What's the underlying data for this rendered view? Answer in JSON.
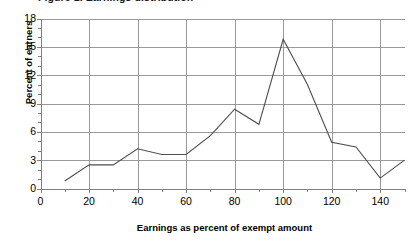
{
  "chart_data": {
    "type": "line",
    "title": "Figure 1. Earnings distribution",
    "xlabel": "Earnings as percent of exempt amount",
    "ylabel": "Percent of earners",
    "x": [
      10,
      20,
      30,
      40,
      50,
      60,
      70,
      80,
      90,
      100,
      110,
      120,
      130,
      140,
      150
    ],
    "values": [
      0.8,
      2.5,
      2.5,
      4.2,
      3.6,
      3.6,
      5.6,
      8.4,
      6.8,
      15.8,
      11.0,
      4.9,
      4.4,
      1.1,
      3.0
    ],
    "series": [
      {
        "name": "Percent of earners",
        "values": [
          0.8,
          2.5,
          2.5,
          4.2,
          3.6,
          3.6,
          5.6,
          8.4,
          6.8,
          15.8,
          11.0,
          4.9,
          4.4,
          1.1,
          3.0
        ]
      }
    ],
    "xlim": [
      0,
      150
    ],
    "ylim": [
      0,
      18
    ],
    "x_ticks": [
      0,
      20,
      40,
      60,
      80,
      100,
      120,
      140
    ],
    "x_minor_tick_step": 10,
    "y_ticks": [
      0,
      3,
      6,
      9,
      12,
      15,
      18
    ],
    "y_minor_tick_step": 1,
    "grid": "both",
    "legend": "none",
    "line_color": "#4d4d4d",
    "grid_color": "#999999",
    "axis_color": "#808080",
    "background": "#ffffff"
  },
  "axes": {
    "y_title": "Percent of earners",
    "x_title": "Earnings as percent of exempt amount",
    "y_tick_labels": [
      "0",
      "3",
      "6",
      "9",
      "12",
      "15",
      "18"
    ],
    "x_tick_labels": [
      "0",
      "20",
      "40",
      "60",
      "80",
      "100",
      "120",
      "140"
    ]
  },
  "title": {
    "text": "Figure 1. Earnings distribution"
  }
}
